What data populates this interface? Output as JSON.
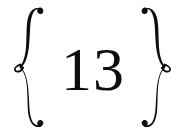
{
  "canvas": {
    "width": 185,
    "height": 134,
    "background_color": "#ffffff",
    "ink_color": "#0d0d0d"
  },
  "ornament": {
    "left_brace": {
      "glyph": "{",
      "icon_name": "left-curly-brace-ornament",
      "style": "calligraphic-swash-with-center-eyelet"
    },
    "right_brace": {
      "glyph": "}",
      "icon_name": "right-curly-brace-ornament",
      "style": "calligraphic-swash-with-center-eyelet"
    }
  },
  "content": {
    "number": "13",
    "digits": [
      "1",
      "3"
    ],
    "typeface_style": "didone-serif"
  }
}
